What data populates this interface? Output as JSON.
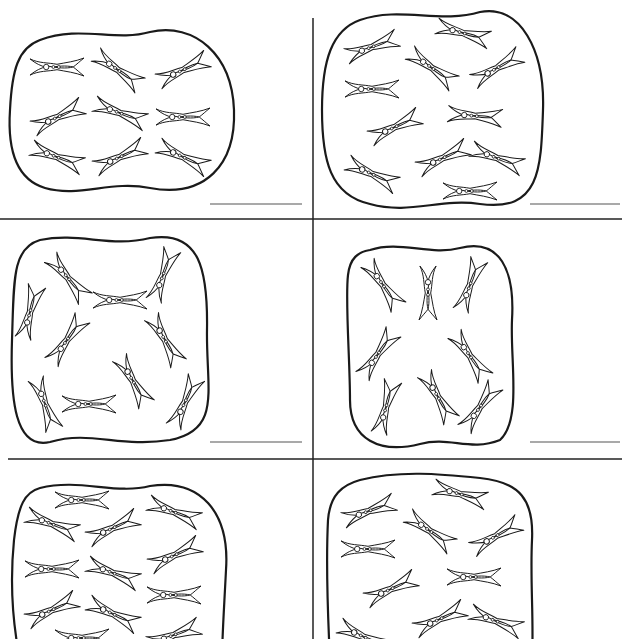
{
  "worksheet": {
    "title_fragment": "",
    "colors": {
      "ink": "#1a1a1a",
      "divider": "#222222",
      "answer_line": "#555555",
      "paper": "#ffffff"
    },
    "dividers": {
      "vertical": {
        "x": 313,
        "y1": 18,
        "y2": 639
      },
      "horizontal": [
        {
          "y": 219,
          "x1": 0,
          "x2": 622
        },
        {
          "y": 459,
          "x1": 8,
          "x2": 622
        }
      ]
    },
    "panels": [
      {
        "id": "panel-1",
        "count": 9,
        "answer_line": {
          "x1": 210,
          "x2": 302,
          "y": 204
        },
        "blob": "M 40 40 C 80 25, 115 42, 150 32 C 195 22, 232 55, 234 110 C 236 165, 205 198, 150 188 C 110 180, 80 198, 45 188 C 12 178, 8 140, 10 110 C 12 70, 18 48, 40 40 Z",
        "pins": [
          [
            57,
            67,
            0
          ],
          [
            118,
            70,
            35
          ],
          [
            183,
            70,
            -25
          ],
          [
            58,
            117,
            -25
          ],
          [
            120,
            113,
            20
          ],
          [
            183,
            117,
            0
          ],
          [
            57,
            157,
            20
          ],
          [
            120,
            157,
            -25
          ],
          [
            183,
            157,
            25
          ]
        ]
      },
      {
        "id": "panel-2",
        "count": 11,
        "answer_line": {
          "x1": 530,
          "x2": 620,
          "y": 204
        },
        "blob": "M 360 20 C 400 6, 440 24, 480 12 C 520 4, 545 50, 543 110 C 541 170, 540 212, 480 204 C 440 198, 410 215, 370 204 C 330 195, 322 160, 322 110 C 322 60, 332 30, 360 20 Z",
        "pins": [
          [
            463,
            33,
            15
          ],
          [
            372,
            47,
            -20
          ],
          [
            432,
            68,
            35
          ],
          [
            497,
            68,
            -30
          ],
          [
            372,
            89,
            0
          ],
          [
            475,
            116,
            5
          ],
          [
            395,
            127,
            -25
          ],
          [
            443,
            158,
            -25
          ],
          [
            497,
            158,
            20
          ],
          [
            372,
            174,
            25
          ],
          [
            470,
            191,
            0
          ]
        ]
      },
      {
        "id": "panel-3",
        "count": 10,
        "answer_line": {
          "x1": 210,
          "x2": 302,
          "y": 442
        },
        "blob": "M 40 240 C 80 232, 110 248, 150 238 C 200 230, 208 270, 207 330 C 206 390, 222 430, 170 440 C 120 448, 90 430, 50 442 C 15 450, 10 400, 12 340 C 14 280, 12 248, 40 240 Z",
        "pins": [
          [
            68,
            278,
            50
          ],
          [
            120,
            300,
            0
          ],
          [
            163,
            275,
            -70
          ],
          [
            30,
            312,
            -75
          ],
          [
            67,
            340,
            -55
          ],
          [
            165,
            340,
            60
          ],
          [
            133,
            381,
            60
          ],
          [
            45,
            404,
            70
          ],
          [
            89,
            404,
            0
          ],
          [
            185,
            402,
            -65
          ]
        ]
      },
      {
        "id": "panel-4",
        "count": 8,
        "answer_line": {
          "x1": 530,
          "x2": 620,
          "y": 442
        },
        "blob": "M 370 250 C 400 240, 430 256, 460 248 C 500 238, 515 270, 512 320 C 510 360, 522 420, 500 440 C 470 452, 450 436, 420 444 C 380 454, 350 440, 350 400 C 350 360, 345 300, 348 275 C 350 258, 358 252, 370 250 Z",
        "pins": [
          [
            383,
            285,
            55
          ],
          [
            428,
            293,
            90
          ],
          [
            470,
            285,
            -70
          ],
          [
            378,
            354,
            -55
          ],
          [
            470,
            356,
            55
          ],
          [
            386,
            407,
            -75
          ],
          [
            438,
            397,
            60
          ],
          [
            480,
            407,
            -55
          ]
        ]
      },
      {
        "id": "panel-5",
        "count": 12,
        "answer_line": null,
        "blob": "M 40 488 C 80 478, 115 495, 150 486 C 200 478, 230 512, 226 570 C 224 610, 222 639, 222 660 L 20 660 C 12 620, 10 580, 14 540 C 18 505, 25 492, 40 488 Z",
        "pins": [
          [
            82,
            500,
            0
          ],
          [
            174,
            512,
            20
          ],
          [
            52,
            524,
            20
          ],
          [
            113,
            528,
            -25
          ],
          [
            52,
            569,
            0
          ],
          [
            113,
            573,
            20
          ],
          [
            175,
            555,
            -25
          ],
          [
            174,
            595,
            0
          ],
          [
            52,
            610,
            -25
          ],
          [
            113,
            614,
            25
          ],
          [
            174,
            635,
            -20
          ],
          [
            82,
            638,
            0
          ]
        ]
      },
      {
        "id": "panel-6",
        "count": 11,
        "answer_line": null,
        "blob": "M 360 480 C 400 470, 440 474, 480 478 C 520 482, 534 500, 532 540 C 530 580, 534 620, 532 660 L 330 660 C 328 620, 326 560, 328 520 C 330 495, 342 485, 360 480 Z",
        "pins": [
          [
            460,
            494,
            15
          ],
          [
            369,
            511,
            -20
          ],
          [
            430,
            531,
            35
          ],
          [
            496,
            536,
            -30
          ],
          [
            368,
            549,
            0
          ],
          [
            474,
            577,
            0
          ],
          [
            391,
            589,
            -25
          ],
          [
            440,
            619,
            -25
          ],
          [
            496,
            621,
            20
          ],
          [
            364,
            637,
            25
          ]
        ]
      }
    ]
  }
}
